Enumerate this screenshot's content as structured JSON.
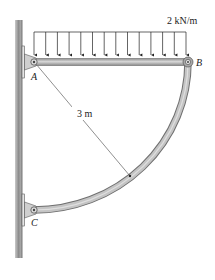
{
  "diagram": {
    "type": "statics-structure",
    "load": {
      "label": "2 kN/m",
      "type": "uniform-distributed",
      "arrow_count": 14
    },
    "points": {
      "A": "A",
      "B": "B",
      "C": "C"
    },
    "dimensions": {
      "radius_label": "3 m"
    },
    "members": [
      {
        "name": "beam-AB",
        "shape": "straight-horizontal"
      },
      {
        "name": "arc-BC",
        "shape": "quarter-circle"
      }
    ],
    "supports": [
      {
        "point": "A",
        "type": "pin-to-wall"
      },
      {
        "point": "C",
        "type": "pin-to-wall"
      }
    ],
    "colors": {
      "member_fill": "#b8b8b8",
      "member_edge": "#777777",
      "wall": "#9a9a9a",
      "line": "#333333"
    }
  }
}
